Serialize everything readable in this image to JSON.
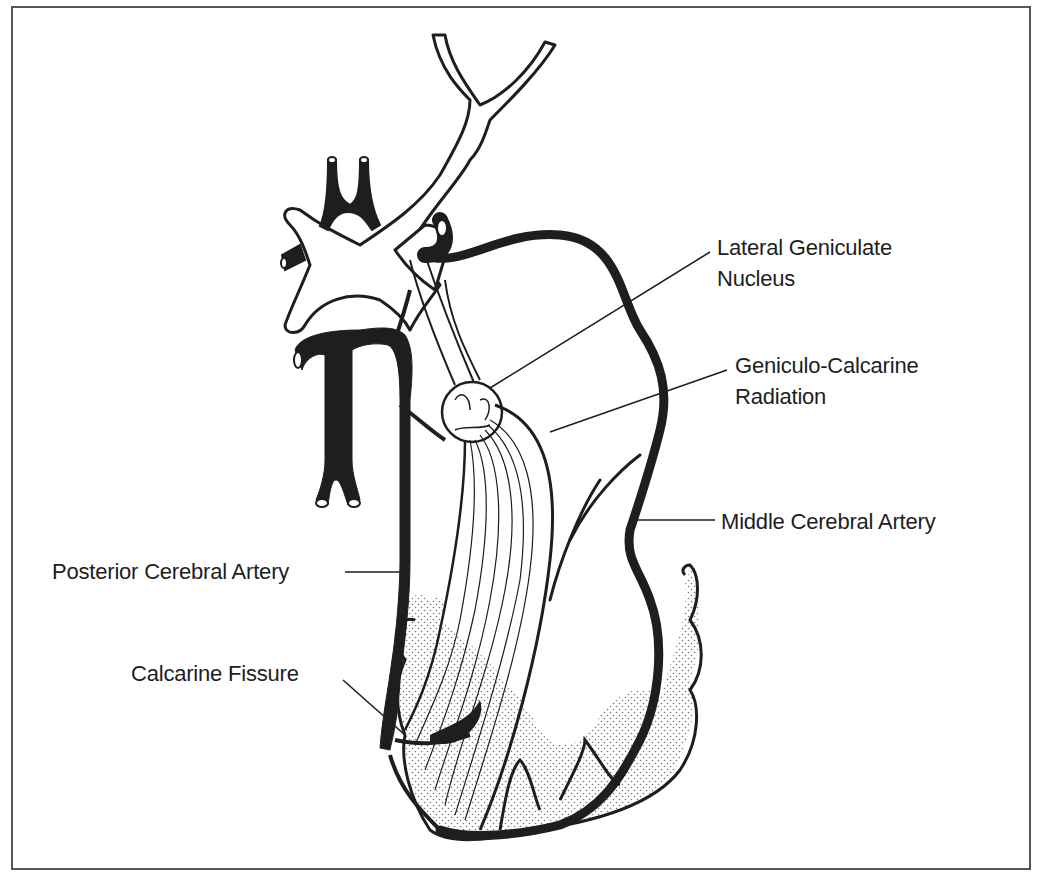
{
  "figure": {
    "labels": {
      "lgn_line1": "Lateral Geniculate",
      "lgn_line2": "Nucleus",
      "gcr_line1": "Geniculo-Calcarine",
      "gcr_line2": "Radiation",
      "mca": "Middle Cerebral Artery",
      "pca": "Posterior Cerebral Artery",
      "calcarine": "Calcarine Fissure"
    },
    "colors": {
      "ink": "#1e1e1e",
      "frame": "#555555",
      "background": "#ffffff"
    }
  }
}
